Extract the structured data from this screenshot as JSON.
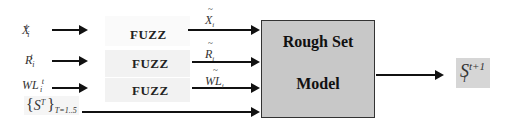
{
  "diagram": {
    "inputs": [
      {
        "base": "X",
        "sub": "i",
        "sup": "t"
      },
      {
        "base": "R",
        "sub": "i",
        "sup": "t"
      },
      {
        "base": "WL",
        "sub": "i",
        "sup": "t"
      },
      {
        "open": "{",
        "base": "S",
        "sub": "i",
        "sup": "T",
        "close": "}",
        "range": "T=1..5"
      }
    ],
    "fuzz_blocks": [
      {
        "label": "FUZZ"
      },
      {
        "label": "FUZZ"
      },
      {
        "label": "FUZZ"
      }
    ],
    "fuzzified_outputs": [
      {
        "tilde": "~",
        "base": "X",
        "sub": "i"
      },
      {
        "tilde": "~",
        "base": "R",
        "sub": "i"
      },
      {
        "tilde": "~",
        "base": "WL",
        "sub": "i"
      }
    ],
    "model": {
      "line1": "Rough Set",
      "line2": "Model"
    },
    "output": {
      "base": "S",
      "sub": "i",
      "sup": "t+1"
    },
    "colors": {
      "model_fill": "#c8c8c8",
      "fuzz_fill": "#f2f2f2",
      "output_fill": "#d6d6d6",
      "arrow": "#111111"
    }
  }
}
